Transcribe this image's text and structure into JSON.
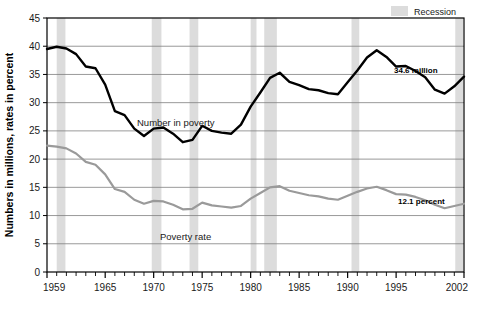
{
  "chart_data": {
    "type": "line",
    "title": "",
    "subtitle": "",
    "xlabel": "",
    "ylabel": "Numbers in millions, rates in percent",
    "xlim": [
      1959,
      2002
    ],
    "ylim": [
      0,
      45
    ],
    "ytick_step": 5,
    "grid": true,
    "grid_axis": "y",
    "legend_position": "top-right",
    "x": [
      1959,
      1960,
      1961,
      1962,
      1963,
      1964,
      1965,
      1966,
      1967,
      1968,
      1969,
      1970,
      1971,
      1972,
      1973,
      1974,
      1975,
      1976,
      1977,
      1978,
      1979,
      1980,
      1981,
      1982,
      1983,
      1984,
      1985,
      1986,
      1987,
      1988,
      1989,
      1990,
      1991,
      1992,
      1993,
      1994,
      1995,
      1996,
      1997,
      1998,
      1999,
      2000,
      2001,
      2002
    ],
    "xticks_labeled": [
      1959,
      1965,
      1970,
      1975,
      1980,
      1985,
      1990,
      1995,
      2002
    ],
    "xtick_labels": [
      "1959",
      "1965",
      "1970",
      "1975",
      "1980",
      "1985",
      "1990",
      "1995",
      "2002"
    ],
    "yticks": [
      0,
      5,
      10,
      15,
      20,
      25,
      30,
      35,
      40,
      45
    ],
    "ytick_labels": [
      "0",
      "5",
      "10",
      "15",
      "20",
      "25",
      "30",
      "35",
      "40",
      "45"
    ],
    "series": [
      {
        "name": "Number in poverty",
        "units": "millions",
        "color": "#000000",
        "linewidth": 2.4,
        "inline_label": "Number in poverty",
        "end_annotation": "34.6 million",
        "values": [
          39.5,
          39.9,
          39.6,
          38.6,
          36.4,
          36.1,
          33.2,
          28.5,
          27.8,
          25.4,
          24.1,
          25.4,
          25.6,
          24.5,
          23.0,
          23.4,
          25.9,
          25.0,
          24.7,
          24.5,
          26.1,
          29.3,
          31.8,
          34.4,
          35.3,
          33.7,
          33.1,
          32.4,
          32.2,
          31.7,
          31.5,
          33.6,
          35.7,
          38.0,
          39.3,
          38.1,
          36.4,
          36.5,
          35.6,
          34.5,
          32.3,
          31.6,
          32.9,
          34.6
        ]
      },
      {
        "name": "Poverty rate",
        "units": "percent",
        "color": "#9a9a9a",
        "linewidth": 2.2,
        "inline_label": "Poverty rate",
        "end_annotation": "12.1 percent",
        "values": [
          22.4,
          22.2,
          21.9,
          21.0,
          19.5,
          19.0,
          17.3,
          14.7,
          14.2,
          12.8,
          12.1,
          12.6,
          12.5,
          11.9,
          11.1,
          11.2,
          12.3,
          11.8,
          11.6,
          11.4,
          11.7,
          13.0,
          14.0,
          15.0,
          15.2,
          14.4,
          14.0,
          13.6,
          13.4,
          13.0,
          12.8,
          13.5,
          14.2,
          14.8,
          15.1,
          14.5,
          13.8,
          13.7,
          13.3,
          12.7,
          11.9,
          11.3,
          11.7,
          12.1
        ]
      }
    ],
    "shaded_regions": {
      "label": "Recession",
      "color": "#dcdcdc",
      "spans": [
        [
          1960.0,
          1960.9
        ],
        [
          1969.8,
          1970.8
        ],
        [
          1973.7,
          1974.6
        ],
        [
          1980.0,
          1980.6
        ],
        [
          1981.4,
          1982.7
        ],
        [
          1990.4,
          1991.2
        ],
        [
          2001.1,
          2001.9
        ]
      ]
    }
  },
  "legend": {
    "recession_label": "Recession"
  },
  "annotations": {
    "number_label": "Number in poverty",
    "rate_label": "Poverty rate",
    "number_end": "34.6 million",
    "rate_end": "12.1 percent"
  },
  "axis": {
    "y_title": "Numbers in millions, rates in percent"
  },
  "colors": {
    "number_line": "#000000",
    "rate_line": "#9a9a9a",
    "recession_band": "#dcdcdc",
    "grid": "#7f7f7f",
    "axis": "#000000",
    "background": "#ffffff"
  }
}
